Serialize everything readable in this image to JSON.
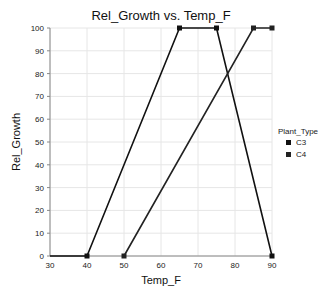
{
  "chart_data": {
    "type": "line",
    "title": "Rel_Growth vs. Temp_F",
    "xlabel": "Temp_F",
    "ylabel": "Rel_Growth",
    "xlim": [
      30,
      90
    ],
    "ylim": [
      0,
      100
    ],
    "xticks": [
      30,
      40,
      50,
      60,
      70,
      80,
      90
    ],
    "yticks": [
      0,
      10,
      20,
      30,
      40,
      50,
      60,
      70,
      80,
      90,
      100
    ],
    "grid": true,
    "legend": {
      "title": "Plant_Type",
      "position": "right",
      "entries": [
        "C3",
        "C4"
      ]
    },
    "series": [
      {
        "name": "C3",
        "color": "#111111",
        "points": [
          [
            30,
            0
          ],
          [
            40,
            0
          ],
          [
            65,
            100
          ],
          [
            75,
            100
          ],
          [
            90,
            0
          ]
        ]
      },
      {
        "name": "C4",
        "color": "#222222",
        "points": [
          [
            50,
            0
          ],
          [
            85,
            100
          ],
          [
            90,
            100
          ]
        ]
      }
    ]
  }
}
